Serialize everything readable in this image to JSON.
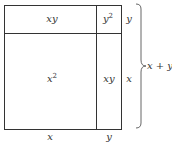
{
  "diagram": {
    "type": "geometric-area-model",
    "regions": [
      {
        "id": "top-left",
        "label": "xy"
      },
      {
        "id": "top-right",
        "label": "y",
        "exponent": "2"
      },
      {
        "id": "bottom-left",
        "label": "x",
        "exponent": "2"
      },
      {
        "id": "bottom-right",
        "label": "xy"
      }
    ],
    "side_labels": {
      "right_top": "y",
      "right_bottom": "x",
      "bottom_left": "x",
      "bottom_right": "y",
      "brace": "x + y"
    },
    "colors": {
      "line": "#333333",
      "background": "#ffffff"
    }
  }
}
